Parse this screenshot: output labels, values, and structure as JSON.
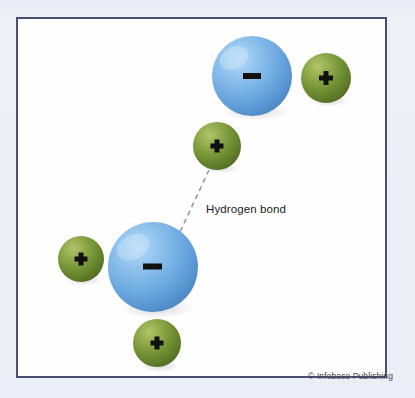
{
  "figure": {
    "background_color": "#eceef5",
    "plate_background": "#fefefe",
    "border_color": "#474f72",
    "label": "Hydrogen bond",
    "credit": "© Infobase Publishing",
    "charge_negative": "−",
    "charge_positive": "+"
  },
  "palette": {
    "oxygen_blue_light": "#9ecbf0",
    "oxygen_blue": "#6aa9e0",
    "oxygen_blue_dark": "#4a8ccb",
    "hydrogen_green_light": "#9cb352",
    "hydrogen_green": "#6f8f33",
    "hydrogen_green_dark": "#566f23",
    "charge_mark": "#111111",
    "bond_line": "#9a9a9a"
  },
  "diagram_data": {
    "type": "molecular-diagram",
    "description": "Two water molecules drawn as ball models, joined by a dashed hydrogen bond.",
    "atoms": [
      {
        "id": "o-top",
        "element": "oxygen",
        "molecule": "upper-water-molecule",
        "charge": "−",
        "color": "#6aa9e0",
        "cx": 252,
        "cy": 76,
        "r": 40
      },
      {
        "id": "h-top-right",
        "element": "hydrogen",
        "molecule": "upper-water-molecule",
        "charge": "+",
        "color": "#6f8f33",
        "cx": 326,
        "cy": 78,
        "r": 25
      },
      {
        "id": "h-top-lower",
        "element": "hydrogen",
        "molecule": "upper-water-molecule",
        "charge": "+",
        "color": "#6f8f33",
        "cx": 217,
        "cy": 146,
        "r": 24
      },
      {
        "id": "o-bottom",
        "element": "oxygen",
        "molecule": "lower-water-molecule",
        "charge": "−",
        "color": "#6aa9e0",
        "cx": 153,
        "cy": 267,
        "r": 45
      },
      {
        "id": "h-bottom-left",
        "element": "hydrogen",
        "molecule": "lower-water-molecule",
        "charge": "+",
        "color": "#6f8f33",
        "cx": 81,
        "cy": 259,
        "r": 23
      },
      {
        "id": "h-bottom-lower",
        "element": "hydrogen",
        "molecule": "lower-water-molecule",
        "charge": "+",
        "color": "#6f8f33",
        "cx": 157,
        "cy": 343,
        "r": 24
      }
    ],
    "bonds": [
      {
        "id": "hydrogen-bond",
        "kind": "hydrogen-bond",
        "style": "dashed",
        "from": "h-top-lower",
        "to": "o-bottom",
        "x1": 209,
        "y1": 170,
        "x2": 180,
        "y2": 232,
        "label": "Hydrogen bond"
      }
    ]
  }
}
